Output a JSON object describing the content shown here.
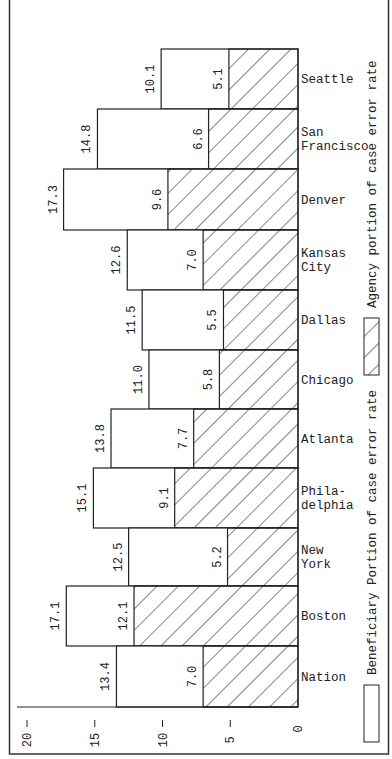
{
  "chart_data": {
    "type": "bar",
    "orientation": "rotated-90-horizontal-bars-growing-left",
    "title": "",
    "xlabel": "",
    "ylabel": "",
    "ylim": [
      0,
      20
    ],
    "yticks": [
      0,
      5,
      10,
      15,
      20
    ],
    "grid": false,
    "legend_position": "right-side, rotated vertical",
    "categories": [
      "Seattle",
      "San Francisco",
      "Denver",
      "Kansas City",
      "Dallas",
      "Chicago",
      "Atlanta",
      "Phila-delphia",
      "New York",
      "Boston",
      "Nation"
    ],
    "category_labels": [
      [
        "Seattle"
      ],
      [
        "San",
        "Francisco"
      ],
      [
        "Denver"
      ],
      [
        "Kansas",
        "City"
      ],
      [
        "Dallas"
      ],
      [
        "Chicago"
      ],
      [
        "Atlanta"
      ],
      [
        "Phila-",
        "delphia"
      ],
      [
        "New",
        "York"
      ],
      [
        "Boston"
      ],
      [
        "Nation"
      ]
    ],
    "series": [
      {
        "name": "Beneficiary Portion of case error rate",
        "pattern": "none",
        "values": [
          10.1,
          14.8,
          17.3,
          12.6,
          11.5,
          11.0,
          13.8,
          15.1,
          12.5,
          17.1,
          13.4
        ],
        "labels": [
          "10.1",
          "14.8",
          "17.3",
          "12.6",
          "11.5",
          "11.0",
          "13.8",
          "15.1",
          "12.5",
          "17.1",
          "13.4"
        ]
      },
      {
        "name": "Agency portion of case error rate",
        "pattern": "diagonal-hatch",
        "values": [
          5.1,
          6.6,
          9.6,
          7.0,
          5.5,
          5.8,
          7.7,
          9.1,
          5.2,
          12.1,
          7.0
        ],
        "labels": [
          "5.1",
          "6.6",
          "9.6",
          "7.0",
          "5.5",
          "5.8",
          "7.7",
          "9.1",
          "5.2",
          "12.1",
          "7.0"
        ]
      }
    ],
    "colors": {
      "ink": "#222222",
      "background": "#ffffff"
    }
  },
  "legend": {
    "agency_label": "Agency portion of case error rate",
    "beneficiary_label": "Beneficiary Portion of case error rate"
  },
  "axis": {
    "tick_labels": [
      "0",
      "5",
      "10",
      "15",
      "20"
    ]
  }
}
